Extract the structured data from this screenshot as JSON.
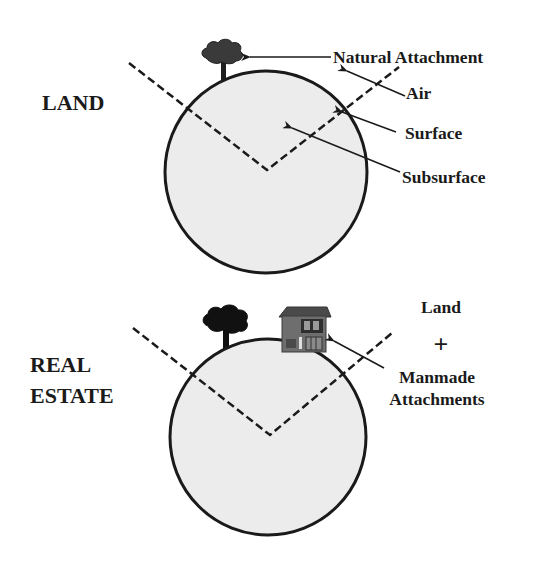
{
  "diagram": {
    "colors": {
      "circle_fill": "#ececec",
      "outline": "#1a1a1a",
      "tree": "#2a2a2a",
      "house_body": "#6e6e6e",
      "house_roof": "#555555"
    },
    "land_panel": {
      "title": "LAND",
      "labels": {
        "natural_attachment": "Natural Attachment",
        "air": "Air",
        "surface": "Surface",
        "subsurface": "Subsurface"
      },
      "icons": [
        "tree-icon"
      ]
    },
    "real_estate_panel": {
      "title_line1": "REAL",
      "title_line2": "ESTATE",
      "labels": {
        "land": "Land",
        "plus": "+",
        "manmade_line1": "Manmade",
        "manmade_line2": "Attachments"
      },
      "icons": [
        "tree-icon",
        "house-icon"
      ]
    }
  }
}
